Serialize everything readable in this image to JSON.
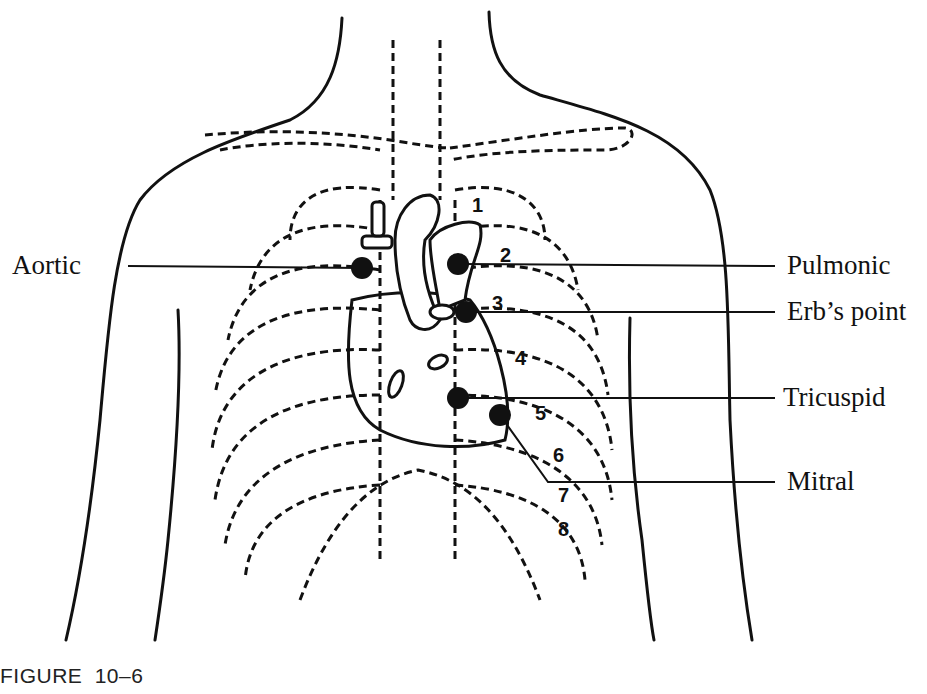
{
  "caption": "FIGURE 10–6",
  "labels": {
    "aortic": "Aortic",
    "pulmonic": "Pulmonic",
    "erbs_point": "Erb’s point",
    "tricuspid": "Tricuspid",
    "mitral": "Mitral"
  },
  "rib_numbers": [
    "1",
    "2",
    "3",
    "4",
    "5",
    "6",
    "7",
    "8"
  ],
  "colors": {
    "ink": "#111111",
    "background": "#ffffff"
  }
}
